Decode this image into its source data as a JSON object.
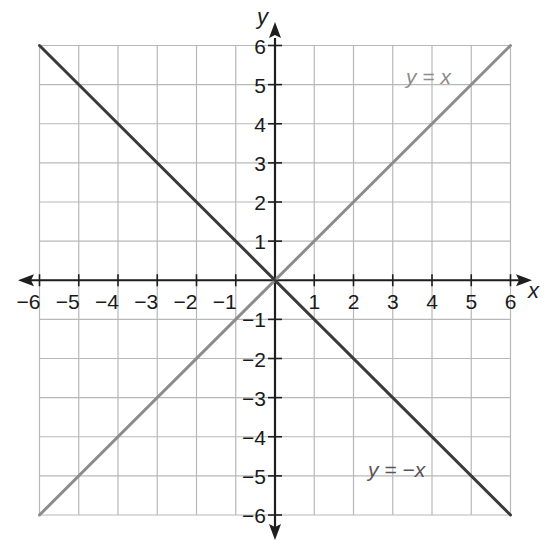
{
  "chart_data": {
    "type": "line",
    "title": "",
    "xlabel": "x",
    "ylabel": "y",
    "xlim": [
      -6,
      6
    ],
    "ylim": [
      -6,
      6
    ],
    "grid": true,
    "x_ticks": [
      -6,
      -5,
      -4,
      -3,
      -2,
      -1,
      1,
      2,
      3,
      4,
      5,
      6
    ],
    "y_ticks": [
      -6,
      -5,
      -4,
      -3,
      -2,
      -1,
      1,
      2,
      3,
      4,
      5,
      6
    ],
    "x_tick_labels": [
      "−6",
      "−5",
      "−4",
      "−3",
      "−2",
      "−1",
      "1",
      "2",
      "3",
      "4",
      "5",
      "6"
    ],
    "y_tick_labels": [
      "−6",
      "−5",
      "−4",
      "−3",
      "−2",
      "−1",
      "1",
      "2",
      "3",
      "4",
      "5",
      "6"
    ],
    "series": [
      {
        "name": "y = x",
        "color": "#8c8c8c",
        "x": [
          -6,
          6
        ],
        "y": [
          -6,
          6
        ],
        "label_position": [
          4.5,
          5.2
        ]
      },
      {
        "name": "y = −x",
        "color": "#3a3a3a",
        "x": [
          -6,
          6
        ],
        "y": [
          6,
          -6
        ],
        "label_position": [
          3.5,
          -5.0
        ]
      }
    ],
    "annotations": [
      "y = x",
      "y = −x"
    ],
    "legend": "none (inline labels)"
  },
  "labels": {
    "x_axis": "x",
    "y_axis": "y",
    "line1": "y = x",
    "line2": "y = −x"
  },
  "colors": {
    "grid": "#b8b8b8",
    "axis": "#1e1e1e",
    "line_y_eq_x": "#8c8c8c",
    "line_y_eq_neg_x": "#3a3a3a",
    "label_y_eq_x": "#8c8c8c",
    "label_y_eq_neg_x": "#555555"
  }
}
